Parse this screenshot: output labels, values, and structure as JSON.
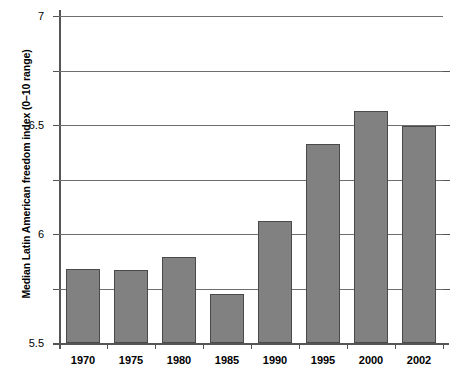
{
  "chart_data": {
    "type": "bar",
    "title": "",
    "xlabel": "",
    "ylabel": "Median Latin American freedom index (0–10 range)",
    "categories": [
      "1970",
      "1975",
      "1980",
      "1985",
      "1990",
      "1995",
      "2000",
      "2002"
    ],
    "values": [
      4.68,
      4.67,
      4.79,
      4.45,
      5.12,
      5.83,
      6.13,
      5.99
    ],
    "ylim": [
      4,
      7
    ],
    "yticks": [
      4,
      4.5,
      5,
      5.5,
      6,
      6.5,
      7
    ],
    "ytick_labels": [
      "4",
      "4.5",
      "5",
      "5.5",
      "6",
      "6.5",
      "7"
    ],
    "grid": true,
    "legend": "none",
    "bar_color": "#818181",
    "bar_border_color": "#4a4a4a",
    "grid_color": "#6e6e6e",
    "axis_color": "#555555"
  }
}
